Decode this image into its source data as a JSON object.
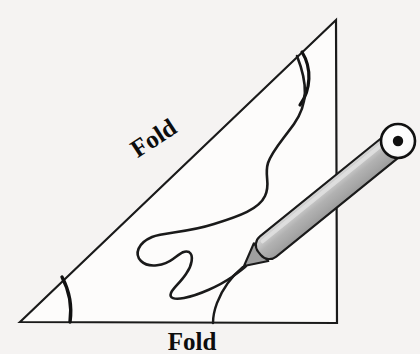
{
  "figure": {
    "background_color": "#f5f3f2",
    "stroke_color": "#1a1a1a",
    "labels": {
      "fold_hypotenuse": "Fold",
      "fold_base": "Fold"
    },
    "label_style": {
      "hypotenuse_rotation_deg": -33,
      "hypotenuse_font_size": 25,
      "base_font_size": 25
    },
    "triangle": {
      "name": "right-triangle-sheet",
      "fill": "#fdfcfb",
      "vertices": [
        {
          "name": "bottom-left",
          "x": 20,
          "y": 322
        },
        {
          "name": "apex-top-right",
          "x": 336,
          "y": 20
        },
        {
          "name": "bottom-right",
          "x": 337,
          "y": 323
        }
      ]
    },
    "arcs": [
      {
        "name": "fold-arc-bottom-left",
        "from_x": 63,
        "from_y": 278,
        "to_x": 70,
        "to_y": 322,
        "bow": 8
      },
      {
        "name": "fold-arc-top",
        "from_x": 302,
        "from_y": 52,
        "to_x": 300,
        "to_y": 104,
        "bow": 9
      }
    ],
    "squiggle": {
      "name": "drawn-wavy-line",
      "description": "hand-drawn wavy line from hypotenuse down to stylus tip and on to base edge",
      "stroke_width": 2.6
    },
    "stylus": {
      "name": "stylus-pen",
      "body_fill": "#b4b4b4",
      "highlight_fill": "#d6d6d6",
      "tip_x": 244,
      "tip_y": 266,
      "cap_center_x": 398,
      "cap_center_y": 141,
      "cap_fill": "#ffffff",
      "cap_dot_fill": "#111111",
      "cap_radius": 17,
      "cap_dot_radius": 5,
      "barrel_half_width": 13
    }
  }
}
